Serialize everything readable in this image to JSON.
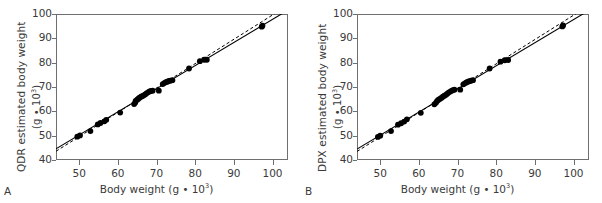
{
  "figure": {
    "background": "#ffffff",
    "axis_color": "#6f6f6f",
    "text_color": "#3a3a3a",
    "marker_color": "#000000"
  },
  "panels": [
    {
      "letter": "A",
      "ylabel_main": "QDR estimated body weight",
      "ylabel_unit_prefix": "(g ",
      "ylabel_unit_dot": "•",
      "ylabel_unit_base": " 10",
      "ylabel_unit_exp": "3",
      "ylabel_unit_suffix": ")",
      "xlabel_prefix": "Body weight (g ",
      "xlabel_dot": "•",
      "xlabel_base": " 10",
      "xlabel_exp": "3",
      "xlabel_suffix": ")"
    },
    {
      "letter": "B",
      "ylabel_main": "DPX estimated body weight",
      "ylabel_unit_prefix": "(g ",
      "ylabel_unit_dot": "•",
      "ylabel_unit_base": " 10",
      "ylabel_unit_exp": "3",
      "ylabel_unit_suffix": ")",
      "xlabel_prefix": "Body weight (g ",
      "xlabel_dot": "•",
      "xlabel_base": " 10",
      "xlabel_exp": "3",
      "xlabel_suffix": ")"
    }
  ],
  "chart_data": [
    {
      "type": "scatter",
      "panel": "A",
      "title": "",
      "xlabel": "Body weight (g • 10^3)",
      "ylabel": "QDR estimated body weight (g • 10^3)",
      "xlim": [
        44,
        104
      ],
      "ylim": [
        40,
        100
      ],
      "xticks": [
        50,
        60,
        70,
        80,
        90,
        100
      ],
      "yticks": [
        40,
        50,
        60,
        70,
        80,
        90,
        100
      ],
      "grid": false,
      "legend": "none",
      "x": [
        49.5,
        50.2,
        52.9,
        54.8,
        55.5,
        56.5,
        57.0,
        60.6,
        64.2,
        64.5,
        64.6,
        65.0,
        65.3,
        65.6,
        66.0,
        66.4,
        66.8,
        67.1,
        67.4,
        67.8,
        68.2,
        68.6,
        69.0,
        70.6,
        71.6,
        72.0,
        72.4,
        72.8,
        73.2,
        73.6,
        74.1,
        78.4,
        81.2,
        82.3,
        83.0,
        97.2,
        97.4
      ],
      "y": [
        49.6,
        50.1,
        51.9,
        54.6,
        55.2,
        55.9,
        56.5,
        59.5,
        63.0,
        63.6,
        64.3,
        64.8,
        65.2,
        65.6,
        66.0,
        66.3,
        66.7,
        67.0,
        67.4,
        67.8,
        68.2,
        68.4,
        68.5,
        68.5,
        71.2,
        71.6,
        72.0,
        72.2,
        72.5,
        72.6,
        72.8,
        77.6,
        80.6,
        81.2,
        81.2,
        94.8,
        95.2
      ],
      "series": [
        {
          "name": "regression line",
          "style": "solid",
          "points": [
            [
              44,
              44.6
            ],
            [
              104,
              101.6
            ]
          ]
        },
        {
          "name": "identity line",
          "style": "dashed",
          "points": [
            [
              44,
              43.6
            ],
            [
              104,
              103.6
            ]
          ]
        }
      ]
    },
    {
      "type": "scatter",
      "panel": "B",
      "title": "",
      "xlabel": "Body weight (g • 10^3)",
      "ylabel": "DPX estimated body weight (g • 10^3)",
      "xlim": [
        44,
        104
      ],
      "ylim": [
        40,
        100
      ],
      "xticks": [
        50,
        60,
        70,
        80,
        90,
        100
      ],
      "yticks": [
        40,
        50,
        60,
        70,
        80,
        90,
        100
      ],
      "grid": false,
      "legend": "none",
      "x": [
        49.4,
        50.0,
        52.8,
        54.6,
        55.4,
        56.2,
        56.9,
        60.5,
        64.0,
        64.4,
        64.7,
        65.0,
        65.4,
        65.8,
        66.2,
        66.6,
        67.0,
        67.3,
        67.6,
        68.0,
        68.4,
        68.8,
        69.2,
        70.7,
        71.5,
        71.9,
        72.3,
        72.7,
        73.1,
        73.5,
        74.0,
        78.3,
        81.1,
        82.2,
        83.1,
        97.1,
        97.3
      ],
      "y": [
        49.5,
        50.0,
        51.9,
        54.5,
        55.1,
        55.8,
        56.7,
        59.4,
        62.9,
        63.5,
        64.2,
        64.7,
        65.1,
        65.5,
        66.0,
        66.4,
        66.8,
        67.2,
        67.6,
        68.0,
        68.4,
        68.7,
        68.9,
        68.9,
        71.1,
        71.5,
        71.9,
        72.2,
        72.4,
        72.6,
        72.8,
        77.6,
        80.4,
        81.0,
        81.1,
        94.9,
        95.3
      ],
      "series": [
        {
          "name": "regression line",
          "style": "solid",
          "points": [
            [
              44,
              44.5
            ],
            [
              104,
              101.5
            ]
          ]
        },
        {
          "name": "identity line",
          "style": "dashed",
          "points": [
            [
              44,
              43.5
            ],
            [
              104,
              103.5
            ]
          ]
        }
      ]
    }
  ]
}
